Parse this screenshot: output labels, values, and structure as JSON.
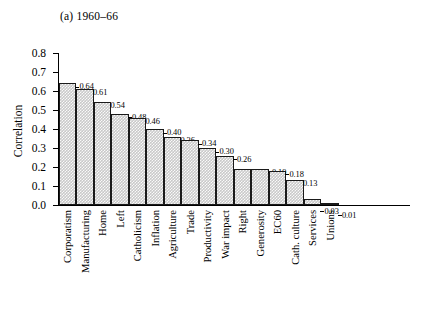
{
  "chart_data": {
    "type": "bar",
    "title": "(a) 1960–66",
    "xlabel": "",
    "ylabel": "Correlation",
    "ylim": [
      0.0,
      0.8
    ],
    "ytick_labels": [
      "0.8",
      "0.7",
      "0.6",
      "0.5",
      "0.4",
      "0.3",
      "0.2",
      "0.1",
      "0.0"
    ],
    "yticks": [
      0.8,
      0.7,
      0.6,
      0.5,
      0.4,
      0.3,
      0.2,
      0.1,
      0.0
    ],
    "grid": false,
    "legend": "none",
    "categories": [
      "Corporatism",
      "Manufacturing",
      "Home",
      "Left",
      "Catholicism",
      "Inflation",
      "Agriculture",
      "Trade",
      "Productivity",
      "War impact",
      "Right",
      "Generosity",
      "EC60",
      "Cath. culture",
      "Services",
      "Unions"
    ],
    "values": [
      0.64,
      0.61,
      0.54,
      0.48,
      0.46,
      0.4,
      0.36,
      0.34,
      0.3,
      0.26,
      0.19,
      0.19,
      0.18,
      0.13,
      0.03,
      0.01
    ],
    "value_labels": [
      "0.64",
      "0.61",
      "0.54",
      "0.48",
      "0.46",
      "0.40",
      "0.36",
      "0.34",
      "0.30",
      "0.26",
      "0.19",
      "0.19",
      "0.18",
      "0.13",
      "0.03",
      "0.01"
    ],
    "bar_fill": "#c9c9c9",
    "bar_edge": "#1a1a1a"
  }
}
